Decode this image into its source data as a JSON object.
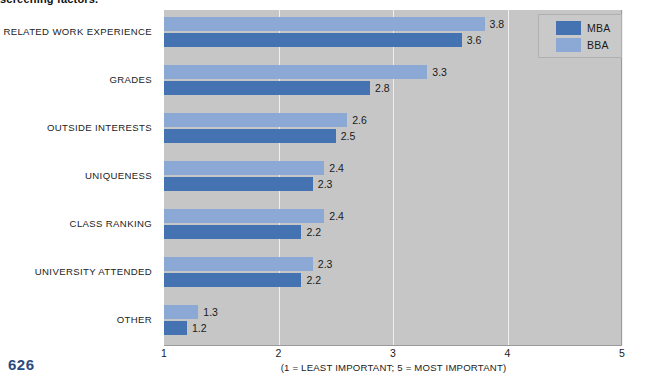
{
  "headline": "screening factors.",
  "page_number": "626",
  "colors": {
    "series_mba": "#4572b0",
    "series_bba": "#8ca9d6",
    "plot_background": "#c6c6c6",
    "gridline": "#f0f0f0",
    "page_number": "#2b4a7e"
  },
  "legend": {
    "position": "top-right",
    "entries": [
      {
        "label": "MBA",
        "color": "#4572b0"
      },
      {
        "label": "BBA",
        "color": "#8ca9d6"
      }
    ]
  },
  "axis": {
    "xticks": [
      "1",
      "2",
      "3",
      "4",
      "5"
    ],
    "caption": "(1 = LEAST IMPORTANT; 5 = MOST IMPORTANT)"
  },
  "chart_data": {
    "type": "bar",
    "orientation": "horizontal",
    "title": "screening factors.",
    "xlabel": "(1 = LEAST IMPORTANT; 5 = MOST IMPORTANT)",
    "ylabel": "",
    "xlim": [
      1,
      5
    ],
    "xticks": [
      1,
      2,
      3,
      4,
      5
    ],
    "grid": true,
    "legend_position": "top-right",
    "categories": [
      "RELATED WORK EXPERIENCE",
      "GRADES",
      "OUTSIDE INTERESTS",
      "UNIQUENESS",
      "CLASS RANKING",
      "UNIVERSITY ATTENDED",
      "OTHER"
    ],
    "series": [
      {
        "name": "BBA",
        "color": "#8ca9d6",
        "values": [
          3.8,
          3.3,
          2.6,
          2.4,
          2.4,
          2.3,
          1.3
        ]
      },
      {
        "name": "MBA",
        "color": "#4572b0",
        "values": [
          3.6,
          2.8,
          2.5,
          2.3,
          2.2,
          2.2,
          1.2
        ]
      }
    ],
    "value_labels": [
      {
        "category": "RELATED WORK EXPERIENCE",
        "bba": "3.8",
        "mba": "3.6"
      },
      {
        "category": "GRADES",
        "bba": "3.3",
        "mba": "2.8"
      },
      {
        "category": "OUTSIDE INTERESTS",
        "bba": "2.6",
        "mba": "2.5"
      },
      {
        "category": "UNIQUENESS",
        "bba": "2.4",
        "mba": "2.3"
      },
      {
        "category": "CLASS RANKING",
        "bba": "2.4",
        "mba": "2.2"
      },
      {
        "category": "UNIVERSITY ATTENDED",
        "bba": "2.3",
        "mba": "2.2"
      },
      {
        "category": "OTHER",
        "bba": "1.3",
        "mba": "1.2"
      }
    ]
  }
}
